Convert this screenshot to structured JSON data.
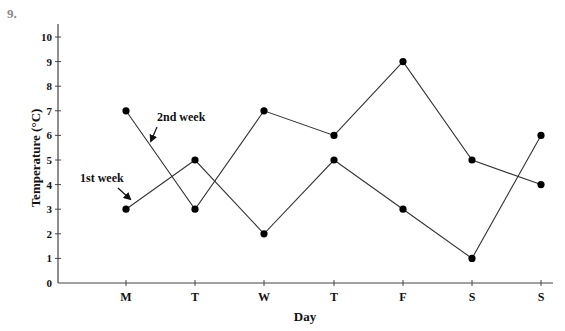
{
  "question_number": "9.",
  "chart_data": {
    "type": "line",
    "title": "",
    "xlabel": "Day",
    "ylabel": "Temperature (°C)",
    "categories": [
      "M",
      "T",
      "W",
      "T",
      "F",
      "S",
      "S"
    ],
    "yticks": [
      0,
      1,
      2,
      3,
      4,
      5,
      6,
      7,
      8,
      9,
      10
    ],
    "ylim": [
      0,
      10
    ],
    "grid": false,
    "legend_position": "inline annotations with arrows",
    "series": [
      {
        "name": "1st week",
        "values": [
          3,
          5,
          2,
          5,
          3,
          1,
          6
        ]
      },
      {
        "name": "2nd week",
        "values": [
          7,
          3,
          7,
          6,
          9,
          5,
          4
        ]
      }
    ],
    "annotations": [
      {
        "text": "1st week",
        "points_to": {
          "series": "1st week",
          "category": "M"
        }
      },
      {
        "text": "2nd week",
        "points_to": {
          "series": "2nd week",
          "segment": "M-T"
        }
      }
    ]
  },
  "colors": {
    "line": "#333333",
    "marker": "#000000",
    "axis": "#444444",
    "question_number": "#888888"
  }
}
